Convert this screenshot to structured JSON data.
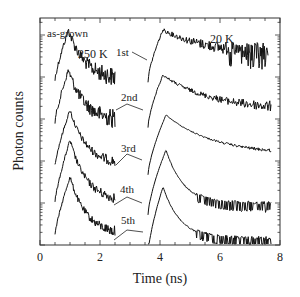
{
  "chart_data": {
    "type": "line",
    "title": "",
    "xlabel": "Time  (ns)",
    "ylabel": "Photon counts",
    "xlim": [
      0,
      8
    ],
    "x_ticks": [
      "0",
      "2",
      "4",
      "6",
      "8"
    ],
    "yscale": "log (offset, arbitrary units)",
    "y_tick_labels": [],
    "grid": false,
    "legend": null,
    "annotations": {
      "sample": "as-grown",
      "temp_left": "250 K",
      "temp_right": "20 K"
    },
    "curve_labels": [
      "1st",
      "2nd",
      "3rd",
      "4th",
      "5th"
    ],
    "panels": [
      {
        "name": "250 K",
        "x_range_ns": [
          0.5,
          2.5
        ],
        "series": [
          {
            "name": "1st",
            "onset_ns": 0.5,
            "peak_ns": 0.95,
            "decay_end_ns": 2.5,
            "noise": "high"
          },
          {
            "name": "2nd",
            "onset_ns": 0.5,
            "peak_ns": 0.95,
            "decay_end_ns": 2.5,
            "noise": "high"
          },
          {
            "name": "3rd",
            "onset_ns": 0.5,
            "peak_ns": 1.0,
            "decay_end_ns": 2.5,
            "noise": "medium"
          },
          {
            "name": "4th",
            "onset_ns": 0.5,
            "peak_ns": 1.0,
            "decay_end_ns": 2.5,
            "noise": "medium"
          },
          {
            "name": "5th",
            "onset_ns": 0.5,
            "peak_ns": 1.0,
            "decay_end_ns": 2.5,
            "noise": "medium"
          }
        ]
      },
      {
        "name": "20 K",
        "x_range_ns": [
          3.6,
          7.7
        ],
        "series": [
          {
            "name": "1st",
            "onset_ns": 3.6,
            "peak_ns": 4.1,
            "decay_end_ns": 7.6,
            "noise": "high"
          },
          {
            "name": "2nd",
            "onset_ns": 3.6,
            "peak_ns": 4.1,
            "decay_end_ns": 7.7,
            "noise": "medium"
          },
          {
            "name": "3rd",
            "onset_ns": 3.6,
            "peak_ns": 4.2,
            "decay_end_ns": 7.7,
            "noise": "low"
          },
          {
            "name": "4th",
            "onset_ns": 3.6,
            "peak_ns": 4.2,
            "decay_end_ns": 7.7,
            "noise": "low"
          },
          {
            "name": "5th",
            "onset_ns": 3.6,
            "peak_ns": 4.1,
            "decay_end_ns": 7.7,
            "noise": "low"
          }
        ]
      }
    ]
  },
  "layout": {
    "plot_px": {
      "left": 40,
      "right": 280,
      "top": 18,
      "bottom": 245
    },
    "curve_baselines_px_250K": [
      80,
      122,
      165,
      202,
      235
    ],
    "curve_peaks_px_250K": [
      30,
      70,
      110,
      140,
      177
    ],
    "curve_baselines_px_20K": [
      56,
      102,
      150,
      190,
      230
    ],
    "curve_peaks_px_20K": [
      20,
      65,
      105,
      140,
      177
    ],
    "curve_tails_px_20K": [
      55,
      110,
      155,
      205,
      240
    ]
  }
}
